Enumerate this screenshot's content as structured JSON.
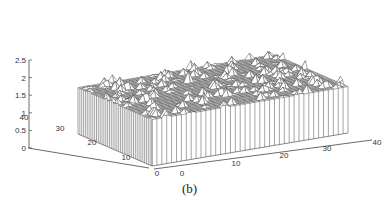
{
  "caption": "(b)",
  "chart_data": {
    "type": "surface",
    "title": "",
    "caption": "(b)",
    "xlabel": "",
    "ylabel": "",
    "zlabel": "",
    "grid_size": [
      40,
      40
    ],
    "x_range": [
      0,
      40
    ],
    "y_range": [
      0,
      40
    ],
    "z_range": [
      0,
      2.5
    ],
    "x_ticks": [
      "0",
      "10",
      "20",
      "30",
      "40"
    ],
    "y_ticks": [
      "0",
      "10",
      "20",
      "30",
      "40"
    ],
    "z_ticks": [
      "0",
      "0.5",
      "1",
      "1.5",
      "2",
      "2.5"
    ],
    "base_level": 2.0,
    "spike_max": 2.5,
    "render": "mesh with curtain",
    "line_color": "#555555"
  }
}
